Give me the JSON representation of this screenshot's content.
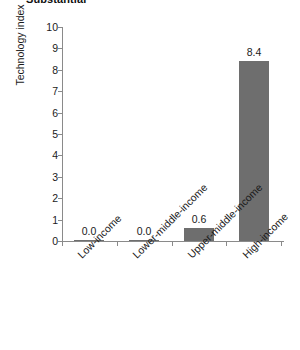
{
  "chart_data": {
    "type": "bar",
    "title": "Substantial",
    "xlabel": "",
    "ylabel": "Technology index",
    "categories": [
      "Low-income",
      "Lower-middle-income",
      "Upper-middle-income",
      "High-income"
    ],
    "values": [
      0.0,
      0.0,
      0.6,
      8.4
    ],
    "value_labels": [
      "0.0",
      "0.0",
      "0.6",
      "8.4"
    ],
    "ylim": [
      0,
      10
    ],
    "ytick_labels": [
      "0",
      "1",
      "2",
      "3",
      "4",
      "5",
      "6",
      "7",
      "8",
      "9",
      "10"
    ],
    "ytick_values": [
      0,
      1,
      2,
      3,
      4,
      5,
      6,
      7,
      8,
      9,
      10
    ],
    "grid": false,
    "legend": "none",
    "bar_color": "#6e6e6e",
    "axis_color": "#8a8a8a",
    "background_color": "#ffffff",
    "text_color": "#1a1a1a"
  }
}
